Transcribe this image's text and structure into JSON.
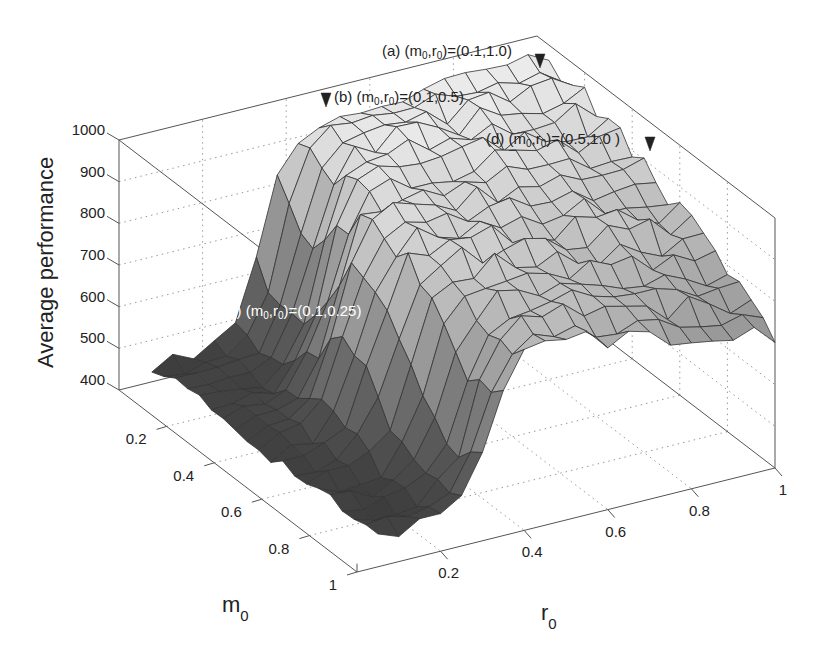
{
  "chart_data": {
    "type": "surface3d",
    "title": "",
    "xlabel": "m",
    "xlabel_sub": "0",
    "ylabel": "r",
    "ylabel_sub": "0",
    "zlabel": "Average performance",
    "x_ticks": [
      "0.2",
      "0.4",
      "0.6",
      "0.8",
      "1"
    ],
    "x_tick_values": [
      0.2,
      0.4,
      0.6,
      0.8,
      1.0
    ],
    "y_ticks": [
      "0.2",
      "0.4",
      "0.6",
      "0.8",
      "1"
    ],
    "y_tick_values": [
      0.2,
      0.4,
      0.6,
      0.8,
      1.0
    ],
    "z_ticks": [
      "400",
      "500",
      "600",
      "700",
      "800",
      "900",
      "1000"
    ],
    "z_tick_values": [
      400,
      500,
      600,
      700,
      800,
      900,
      1000
    ],
    "xlim": [
      0,
      1
    ],
    "ylim": [
      0,
      1
    ],
    "zlim": [
      400,
      1000
    ],
    "grid": true,
    "colormap": "gray",
    "grid_m": [
      0.05,
      0.1,
      0.15,
      0.2,
      0.25,
      0.3,
      0.35,
      0.4,
      0.45,
      0.5,
      0.55,
      0.6,
      0.65,
      0.7,
      0.75,
      0.8,
      0.85,
      0.9,
      0.95,
      1.0
    ],
    "grid_r": [
      0.05,
      0.1,
      0.15,
      0.2,
      0.25,
      0.3,
      0.35,
      0.4,
      0.45,
      0.5,
      0.55,
      0.6,
      0.65,
      0.7,
      0.75,
      0.8,
      0.85,
      0.9,
      0.95,
      1.0
    ],
    "surface_model": {
      "low_level": 470,
      "high_level_at_m0": 975,
      "high_level_at_m1": 720,
      "step_center_r": 0.3,
      "step_width": 0.035,
      "noise_amplitude": 30
    },
    "annotations": [
      {
        "id": "a",
        "label_prefix": "(a) (m",
        "sub1": "0",
        "mid": ",r",
        "sub2": "0",
        "label_suffix": ")=(0.1,1.0)",
        "m": 0.1,
        "r": 1.0,
        "marker_color": "#222222",
        "text_color": "#222222",
        "marker_side": "right"
      },
      {
        "id": "b",
        "label_prefix": "(b) (m",
        "sub1": "0",
        "mid": ",r",
        "sub2": "0",
        "label_suffix": ")=(0.1,0.5)",
        "m": 0.1,
        "r": 0.5,
        "marker_color": "#222222",
        "text_color": "#222222",
        "marker_side": "left"
      },
      {
        "id": "c",
        "label_prefix": "(c) (m",
        "sub1": "0",
        "mid": ",r",
        "sub2": "0",
        "label_suffix": ")=(0.1,0.25)",
        "m": 0.1,
        "r": 0.25,
        "marker_color": "#ffffff",
        "text_color": "#ffffff",
        "marker_side": "left"
      },
      {
        "id": "d",
        "label_prefix": "(d) (m",
        "sub1": "0",
        "mid": ",r",
        "sub2": "0",
        "label_suffix": ")=(0.5,1.0 )",
        "m": 0.5,
        "r": 1.0,
        "marker_color": "#222222",
        "text_color": "#222222",
        "marker_side": "right"
      }
    ]
  },
  "projection": {
    "origin": [
      119,
      390
    ],
    "vm": [
      238,
      182
    ],
    "vr": [
      418,
      -104
    ],
    "vz_per_600": [
      0,
      -250
    ]
  },
  "labels": {
    "z_axis_title": "Average performance",
    "m_axis_main": "m",
    "m_axis_sub": "0",
    "r_axis_main": "r",
    "r_axis_sub": "0"
  }
}
